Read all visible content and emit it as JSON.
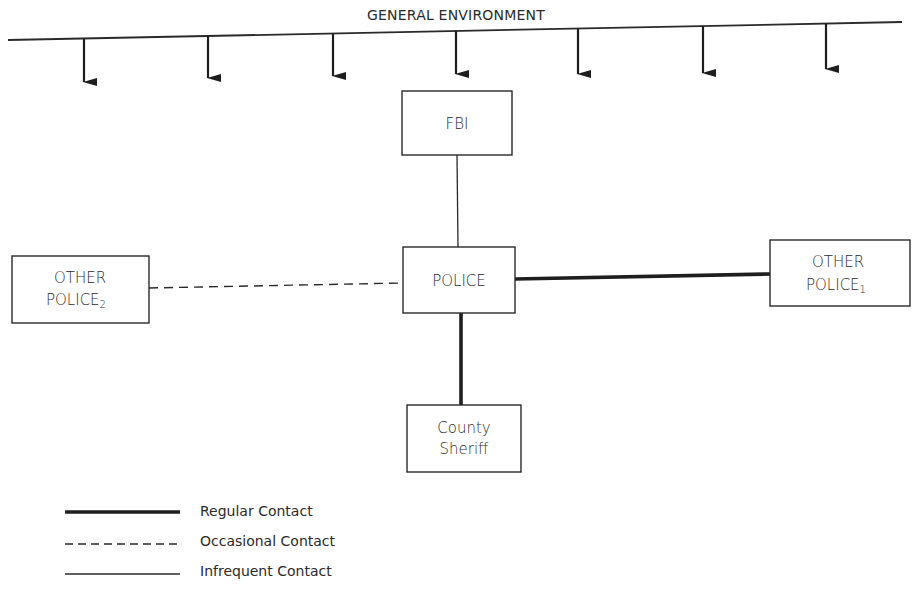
{
  "title": "GENERAL ENVIRONMENT",
  "nodes": {
    "fbi": {
      "line1": "FBI"
    },
    "police": {
      "line1": "POLICE"
    },
    "other_police_2": {
      "line1": "OTHER",
      "line2": "POLICE",
      "subscript": "2"
    },
    "other_police_1": {
      "line1": "OTHER",
      "line2": "POLICE",
      "subscript": "1"
    },
    "county_sheriff": {
      "line1": "County",
      "line2": "Sheriff"
    }
  },
  "edges": [
    {
      "from": "police",
      "to": "fbi",
      "type": "infrequent"
    },
    {
      "from": "police",
      "to": "other_police_1",
      "type": "regular"
    },
    {
      "from": "police",
      "to": "other_police_2",
      "type": "occasional"
    },
    {
      "from": "police",
      "to": "county_sheriff",
      "type": "regular"
    }
  ],
  "legend": {
    "regular": "Regular Contact",
    "occasional": "Occasional Contact",
    "infrequent": "Infrequent Contact"
  },
  "environment_arrows": 7,
  "colors": {
    "ink": "#2a2a2a",
    "background": "#ffffff"
  }
}
